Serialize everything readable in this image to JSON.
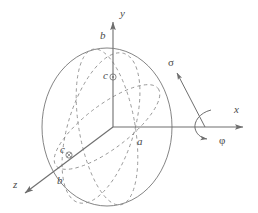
{
  "figure": {
    "background_color": "#ffffff",
    "stroke_color": "#6e6e6e",
    "dashed_stroke_color": "#8a8a8a",
    "label_color": "#4a4a4a"
  },
  "axes": [
    {
      "id": "y",
      "label": "y",
      "direction": "up",
      "label_x": 120,
      "label_y": 8,
      "tip_x": 113,
      "tip_y": 18,
      "origin_x": 113,
      "origin_y": 127
    },
    {
      "id": "x",
      "label": "x",
      "direction": "right",
      "label_x": 234,
      "label_y": 105,
      "tip_x": 247,
      "tip_y": 127,
      "origin_x": 113,
      "origin_y": 127
    },
    {
      "id": "z",
      "label": "z",
      "direction": "down-left",
      "label_x": 13,
      "label_y": 180,
      "tip_x": 21,
      "tip_y": 196,
      "origin_x": 113,
      "origin_y": 127
    }
  ],
  "vectors": [
    {
      "id": "sigma",
      "label": "σ",
      "label_x": 168,
      "label_y": 58,
      "tail_x": 205,
      "tail_y": 127,
      "tip_x": 176,
      "tip_y": 72
    }
  ],
  "rotation": {
    "id": "phi",
    "label": "φ",
    "label_x": 219,
    "label_y": 136,
    "about_axis": "x",
    "arc_center_x": 205,
    "arc_center_y": 127
  },
  "semi_axis_labels": [
    {
      "id": "b-top",
      "label": "b",
      "x": 100,
      "y": 31,
      "marker": "none"
    },
    {
      "id": "c-upper",
      "label": "c",
      "x": 103,
      "y": 71,
      "marker": "circle-dot",
      "marker_x": 113,
      "marker_y": 77
    },
    {
      "id": "a-right",
      "label": "a",
      "x": 137,
      "y": 137,
      "marker": "none"
    },
    {
      "id": "c-lower",
      "label": "c",
      "x": 60,
      "y": 145,
      "marker": "circle-cross",
      "marker_x": 69,
      "marker_y": 155
    },
    {
      "id": "b-zfront",
      "label": "b",
      "x": 57,
      "y": 176,
      "marker": "none"
    }
  ],
  "ellipsoid": {
    "outline": {
      "center_x": 107,
      "center_y": 127,
      "rx": 65,
      "ry": 79
    },
    "dashed_curves": [
      {
        "id": "tilted-equator-ellipse",
        "style": "dashed"
      },
      {
        "id": "meridian-ellipse",
        "style": "dashed"
      },
      {
        "id": "z-plane-ellipse",
        "style": "dashed"
      }
    ]
  }
}
